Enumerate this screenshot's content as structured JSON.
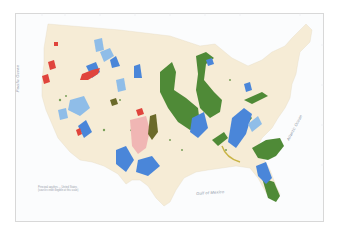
{
  "map": {
    "title": "",
    "labels": {
      "pacific": "Pacific Ocean",
      "atlantic": "Atlantic Ocean",
      "gulf": "Gulf of Mexico"
    },
    "legend_note": {
      "line1": "Principal aquifers ... United States",
      "line2": "(source credit illegible at this scale)"
    },
    "colors": {
      "land": "#f6ecd6",
      "frame": "#d8d8d8",
      "ocean": "#fbfcfd",
      "blue_aquifer": "#4a86d9",
      "light_blue_aquifer": "#8fbde8",
      "green_aquifer": "#4f8a37",
      "red_aquifer": "#e0443c",
      "pink_aquifer": "#f0b6b4",
      "olive_aquifer": "#6b6a2a",
      "yellow_aquifer": "#c9b445"
    }
  }
}
